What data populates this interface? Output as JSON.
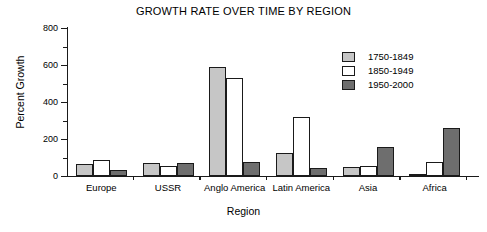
{
  "chart_data": {
    "type": "bar",
    "title": "GROWTH RATE OVER TIME BY REGION",
    "xlabel": "Region",
    "ylabel": "Percent Growth",
    "categories": [
      "Europe",
      "USSR",
      "Anglo America",
      "Latin America",
      "Asia",
      "Africa"
    ],
    "series": [
      {
        "name": "1750-1849",
        "color": "#c6c6c6",
        "values": [
          65,
          72,
          590,
          125,
          50,
          3
        ]
      },
      {
        "name": "1850-1949",
        "color": "#ffffff",
        "values": [
          88,
          55,
          530,
          320,
          55,
          78
        ]
      },
      {
        "name": "1950-2000",
        "color": "#6e6e6e",
        "values": [
          30,
          70,
          75,
          45,
          155,
          260
        ]
      }
    ],
    "ylim": [
      0,
      800
    ],
    "ytick_labels": [
      "0",
      "200",
      "400",
      "600",
      "800"
    ],
    "ytick_values": [
      0,
      200,
      400,
      600,
      800
    ],
    "yminor_values": [
      100,
      300,
      500,
      700
    ],
    "grid": false,
    "legend_position": "top-right",
    "bar_outline_color": "#1a1a1a",
    "axis_color": "#1a1a1a"
  }
}
